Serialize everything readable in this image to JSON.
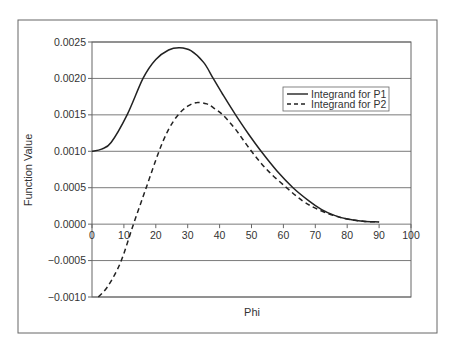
{
  "chart_data": {
    "type": "line",
    "title": "",
    "xlabel": "Phi",
    "ylabel": "Function Value",
    "xlim": [
      0,
      100
    ],
    "ylim": [
      -0.001,
      0.0025
    ],
    "grid": "horizontal",
    "legend_position": "upper-right inside",
    "x_ticks": [
      "0",
      "10",
      "20",
      "30",
      "40",
      "50",
      "60",
      "70",
      "80",
      "90",
      "100"
    ],
    "y_ticks": [
      "0.0025",
      "0.0020",
      "0.0015",
      "0.0010",
      "0.0005",
      "0.0000",
      "-0.0005",
      "-0.0010"
    ],
    "series": [
      {
        "name": "Integrand for P1",
        "style": "solid",
        "x": [
          0,
          3,
          6,
          11,
          16,
          20,
          24,
          27.5,
          31,
          35,
          38,
          41,
          45,
          49,
          53,
          58,
          63,
          68,
          72,
          76,
          80,
          85,
          90
        ],
        "y": [
          0.001,
          0.00103,
          0.00112,
          0.0015,
          0.002,
          0.00226,
          0.00239,
          0.00242,
          0.00238,
          0.00222,
          0.002,
          0.00178,
          0.0015,
          0.00124,
          0.001,
          0.00073,
          0.0005,
          0.00032,
          0.0002,
          0.00012,
          7e-05,
          4e-05,
          3e-05
        ]
      },
      {
        "name": "Integrand for P2",
        "style": "dashed",
        "x": [
          2,
          5,
          9,
          13,
          17,
          21,
          24,
          27,
          30,
          33,
          36,
          38,
          41,
          45,
          50,
          55,
          61,
          66,
          70,
          75,
          80,
          85,
          90
        ],
        "y": [
          -0.001,
          -0.00085,
          -0.00052,
          0.0,
          0.0005,
          0.001,
          0.0013,
          0.0015,
          0.00162,
          0.00167,
          0.00165,
          0.0016,
          0.0015,
          0.0013,
          0.001,
          0.00074,
          0.0005,
          0.00032,
          0.00022,
          0.00013,
          7e-05,
          4e-05,
          3e-05
        ]
      }
    ]
  },
  "colors": {
    "line": "#222222",
    "grid": "#7a7a7a",
    "frame": "#666666",
    "text": "#333333"
  }
}
